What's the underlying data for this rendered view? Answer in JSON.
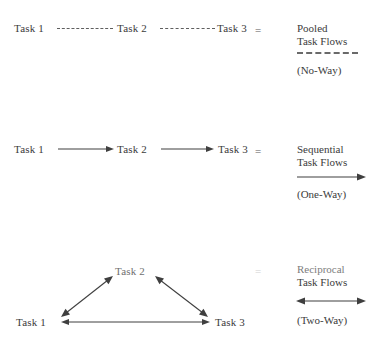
{
  "figure": {
    "background_color": "#ffffff",
    "ink_color": "#3b3b3b",
    "groups": [
      {
        "id": "pooled",
        "connector_style": "dashed",
        "nodes": [
          "Task 1",
          "Task 2",
          "Task 3"
        ],
        "equals_sign": "=",
        "legend_title_line1": "Pooled",
        "legend_title_line2": "Task Flows",
        "legend_symbol": "dashed-line",
        "legend_caption": "(No-Way)"
      },
      {
        "id": "sequential",
        "connector_style": "single-arrow",
        "nodes": [
          "Task 1",
          "Task 2",
          "Task 3"
        ],
        "equals_sign": "=",
        "legend_title_line1": "Sequential",
        "legend_title_line2": "Task Flows",
        "legend_symbol": "one-way-arrow",
        "legend_caption": "(One-Way)"
      },
      {
        "id": "reciprocal",
        "connector_style": "double-arrow-triangle",
        "nodes": [
          "Task 2",
          "Task 1",
          "Task 3"
        ],
        "equals_sign": "=",
        "legend_title_line1": "Reciprocal",
        "legend_title_line2": "Task Flows",
        "legend_symbol": "two-way-arrow",
        "legend_caption": "(Two-Way)"
      }
    ]
  }
}
